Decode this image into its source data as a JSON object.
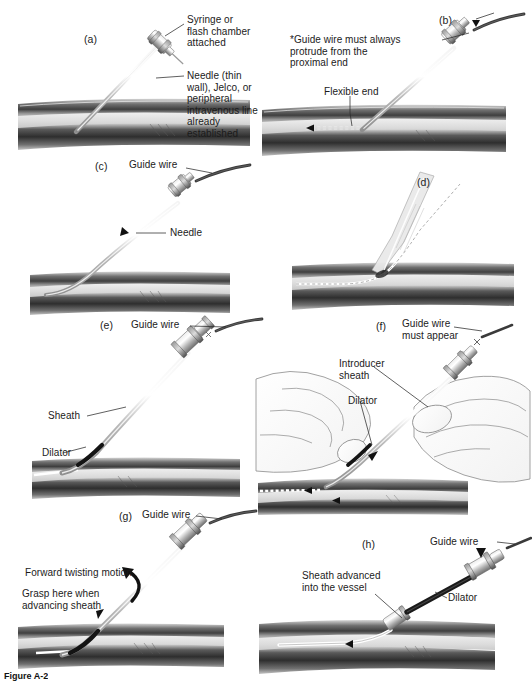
{
  "figure": {
    "caption": "Figure A-2",
    "panel_count": 8,
    "colors": {
      "ink": "#1b1b1b",
      "leader_line": "#2b2b2b",
      "guide_wire": "#3a3a3a",
      "needle_body": "#c9c9c9",
      "hub_gray": "#8c8c8c",
      "dilator_black": "#111111",
      "tissue_dark": "#4a4a4a",
      "tissue_mid": "#8e8e8e",
      "tissue_light": "#cfcfcf",
      "vessel_lumen": "#e6e6e6",
      "hand_outline": "#8a8a8a",
      "background": "#ffffff"
    },
    "panels": [
      {
        "id": "a",
        "label": "(a)",
        "annotations": [
          {
            "name": "syringe-label",
            "text": "Syringe or\nflash chamber\nattached"
          },
          {
            "name": "needle-label",
            "text": "Needle (thin wall), Jelco, or\nperipheral intravenous line\nalready established"
          }
        ]
      },
      {
        "id": "b",
        "label": "(b)",
        "annotations": [
          {
            "name": "guide-wire-protrude-label",
            "text": "*Guide wire must always\nprotrude from the\nproximal end"
          },
          {
            "name": "flexible-end-label",
            "text": "Flexible end"
          }
        ]
      },
      {
        "id": "c",
        "label": "(c)",
        "annotations": [
          {
            "name": "guide-wire-label",
            "text": "Guide wire"
          },
          {
            "name": "needle-label",
            "text": "Needle"
          }
        ]
      },
      {
        "id": "d",
        "label": "(d)",
        "annotations": []
      },
      {
        "id": "e",
        "label": "(e)",
        "annotations": [
          {
            "name": "guide-wire-label",
            "text": "Guide wire"
          },
          {
            "name": "sheath-label",
            "text": "Sheath"
          },
          {
            "name": "dilator-label",
            "text": "Dilator"
          }
        ]
      },
      {
        "id": "f",
        "label": "(f)",
        "annotations": [
          {
            "name": "guide-wire-must-appear-label",
            "text": "Guide wire\nmust appear"
          },
          {
            "name": "introducer-sheath-label",
            "text": "Introducer\nsheath"
          },
          {
            "name": "dilator-label",
            "text": "Dilator"
          }
        ]
      },
      {
        "id": "g",
        "label": "(g)",
        "annotations": [
          {
            "name": "guide-wire-label",
            "text": "Guide wire"
          },
          {
            "name": "forward-twisting-label",
            "text": "Forward twisting motion"
          },
          {
            "name": "grasp-here-label",
            "text": "Grasp here when\nadvancing sheath"
          }
        ]
      },
      {
        "id": "h",
        "label": "(h)",
        "annotations": [
          {
            "name": "guide-wire-label",
            "text": "Guide wire"
          },
          {
            "name": "sheath-advanced-label",
            "text": "Sheath advanced\ninto the vessel"
          },
          {
            "name": "dilator-label",
            "text": "Dilator"
          }
        ]
      }
    ]
  }
}
